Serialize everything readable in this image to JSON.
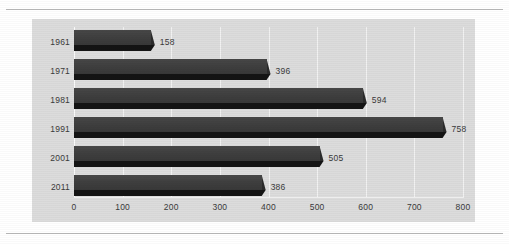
{
  "chart_data": {
    "type": "bar",
    "orientation": "horizontal",
    "title": "",
    "xlabel": "",
    "ylabel": "",
    "categories": [
      "1961",
      "1971",
      "1981",
      "1991",
      "2001",
      "2011"
    ],
    "values": [
      158,
      396,
      594,
      758,
      505,
      386
    ],
    "value_labels": [
      "158",
      "396",
      "594",
      "758",
      "505",
      "386"
    ],
    "xlim": [
      0,
      800
    ],
    "xticks": [
      0,
      100,
      200,
      300,
      400,
      500,
      600,
      700,
      800
    ],
    "xtick_labels": [
      "0",
      "100",
      "200",
      "300",
      "400",
      "500",
      "600",
      "700",
      "800"
    ],
    "grid": true,
    "grid_axis": "x",
    "legend": null,
    "colors": {
      "bar_face": "#3e3e3e",
      "bar_shadow": "#141414",
      "panel_background": "#dcdcdc",
      "gridline": "#f2f2f2",
      "text": "#3a3a3a",
      "rule": "#b9b9b9",
      "page_background": "#ffffff"
    }
  }
}
